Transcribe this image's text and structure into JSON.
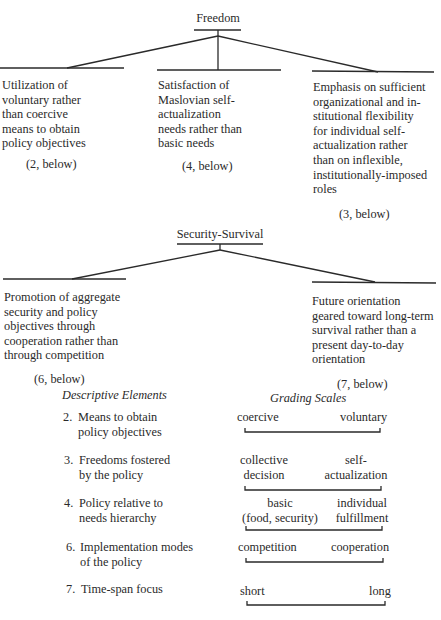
{
  "freedom": {
    "title": "Freedom",
    "branches": [
      {
        "text": "Utilization of\nvoluntary rather\nthan coercive\nmeans to obtain\npolicy objectives",
        "ref": "(2, below)"
      },
      {
        "text": "Satisfaction of\nMaslovian self-\nactualization\nneeds rather than\nbasic needs",
        "ref": "(4, below)"
      },
      {
        "text": "Emphasis on sufficient\norganizational and in-\nstitutional flexibility\nfor individual self-\nactualization rather\nthan on inflexible,\ninstitutionally-imposed\nroles",
        "ref": "(3, below)"
      }
    ]
  },
  "security": {
    "title": "Security-Survival",
    "branches": [
      {
        "text": "Promotion of aggregate\nsecurity and policy\nobjectives through\ncooperation rather than\nthrough competition",
        "ref": "(6, below)"
      },
      {
        "text": "Future orientation\ngeared toward long-term\nsurvival rather than a\npresent day-to-day\norientation",
        "ref": "(7, below)"
      }
    ]
  },
  "table": {
    "left_header": "Descriptive Elements",
    "right_header": "Grading Scales",
    "rows": [
      {
        "num": "2.",
        "label": "Means to obtain\npolicy objectives",
        "low": "coercive",
        "high": "voluntary"
      },
      {
        "num": "3.",
        "label": "Freedoms fostered\nby the policy",
        "low": "collective\ndecision",
        "high": "self-\nactualization"
      },
      {
        "num": "4.",
        "label": "Policy relative to\nneeds hierarchy",
        "low": "basic\n(food, security)",
        "high": "individual\nfulfillment"
      },
      {
        "num": "6.",
        "label": "Implementation modes\nof the policy",
        "low": "competition",
        "high": "cooperation"
      },
      {
        "num": "7.",
        "label": "Time-span focus",
        "low": "short",
        "high": "long"
      }
    ]
  }
}
